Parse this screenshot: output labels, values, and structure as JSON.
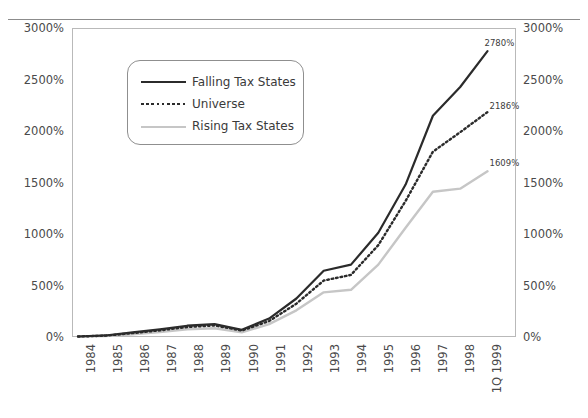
{
  "chart_data": {
    "type": "line",
    "title": "",
    "xlabel": "",
    "ylabel": "",
    "ylim": [
      0,
      3000
    ],
    "ytick_labels": [
      "3000%",
      "2500%",
      "2000%",
      "1500%",
      "1000%",
      "500%",
      "0%"
    ],
    "ytick_values": [
      3000,
      2500,
      2000,
      1500,
      1000,
      500,
      0
    ],
    "dual_y_axis": true,
    "grid": false,
    "legend_position": "upper-left-inside",
    "categories": [
      "1984",
      "1985",
      "1986",
      "1987",
      "1988",
      "1989",
      "1990",
      "1991",
      "1992",
      "1993",
      "1994",
      "1995",
      "1996",
      "1997",
      "1998",
      "1Q 1999"
    ],
    "series": [
      {
        "name": "Falling Tax States",
        "color": "#2b2b2b",
        "style": "solid",
        "values": [
          0,
          10,
          40,
          70,
          105,
          120,
          65,
          175,
          370,
          640,
          700,
          1010,
          1480,
          2150,
          2430,
          2780
        ],
        "end_label": "2780%"
      },
      {
        "name": "Universe",
        "color": "#2b2b2b",
        "style": "dotted",
        "values": [
          0,
          8,
          33,
          60,
          92,
          108,
          58,
          150,
          320,
          545,
          600,
          890,
          1320,
          1800,
          1990,
          2186
        ],
        "end_label": "2186%"
      },
      {
        "name": "Rising Tax States",
        "color": "#c6c6c6",
        "style": "solid",
        "values": [
          0,
          5,
          22,
          44,
          70,
          80,
          40,
          120,
          255,
          430,
          455,
          700,
          1060,
          1410,
          1440,
          1609
        ],
        "end_label": "1609%"
      }
    ],
    "data_labels": [
      {
        "text": "2780%",
        "series": "Falling Tax States"
      },
      {
        "text": "2186%",
        "series": "Universe"
      },
      {
        "text": "1609%",
        "series": "Rising Tax States"
      }
    ]
  },
  "legend": {
    "items": [
      {
        "label": "Falling Tax States",
        "swatch": "solid-dark"
      },
      {
        "label": "Universe",
        "swatch": "dotted-dark"
      },
      {
        "label": "Rising Tax States",
        "swatch": "solid-light"
      }
    ]
  },
  "axis": {
    "left_ticks": [
      "3000%",
      "2500%",
      "2000%",
      "1500%",
      "1000%",
      "500%",
      "0%"
    ],
    "right_ticks": [
      "3000%",
      "2500%",
      "2000%",
      "1500%",
      "1000%",
      "500%",
      "0%"
    ],
    "x_ticks": [
      "1984",
      "1985",
      "1986",
      "1987",
      "1988",
      "1989",
      "1990",
      "1991",
      "1992",
      "1993",
      "1994",
      "1995",
      "1996",
      "1997",
      "1998",
      "1Q 1999"
    ]
  }
}
